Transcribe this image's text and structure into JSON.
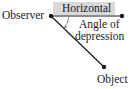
{
  "diagram": {
    "labels": {
      "observer": "Observer",
      "horizontal": "Horizontal",
      "angle_line1": "Angle of",
      "angle_line2": "depression",
      "object": "Object"
    },
    "colors": {
      "line": "#1a1a1a",
      "horizontal_box": "#d9d9d9",
      "arc": "#888888"
    }
  }
}
